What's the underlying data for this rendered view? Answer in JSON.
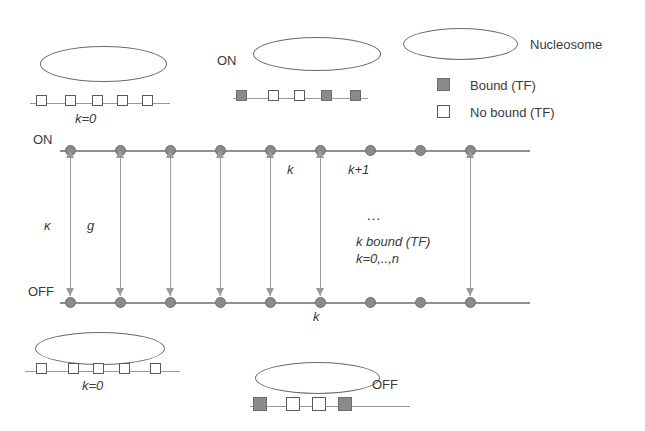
{
  "figure": {
    "type": "state-transition-diagram"
  },
  "legend": {
    "nucleosome_label": "Nucleosome",
    "bound_label": "Bound (TF)",
    "no_bound_label": "No bound (TF)",
    "bound_color": "#8a8a8a",
    "no_bound_color": "#ffffff"
  },
  "top_left_group": {
    "k_label": "k=0",
    "squares": [
      "open",
      "open",
      "open",
      "open",
      "open"
    ]
  },
  "top_middle_group": {
    "state_label": "ON",
    "squares": [
      "fill",
      "open",
      "open",
      "fill",
      "fill"
    ]
  },
  "bottom_left_group": {
    "k_label": "k=0",
    "squares": [
      "open",
      "open",
      "open",
      "open",
      "open"
    ]
  },
  "bottom_right_group": {
    "state_label": "OFF",
    "squares": [
      "fill",
      "open",
      "open",
      "fill"
    ]
  },
  "lattice": {
    "on_label": "ON",
    "off_label": "OFF",
    "kappa_label": "κ",
    "g_label": "g",
    "k_top_label": "k",
    "k_plus_one_label": "k+1",
    "k_bottom_label": "k",
    "ellipsis": "…",
    "center_line1": "k bound (TF)",
    "center_line2": "k=0,..,n",
    "node_count": 9,
    "node_color": "#8a8a8a",
    "rail_color": "#8f8f8f",
    "arrow_color": "#9a9a9a"
  }
}
